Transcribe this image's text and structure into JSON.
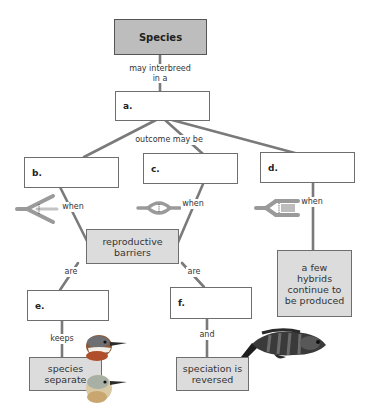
{
  "diagram": {
    "type": "concept-map",
    "colors": {
      "line": "#7a7a7a",
      "title_box_fill": "#bdbdbd",
      "filled_box": "#dcdcdc",
      "empty_box": "#ffffff",
      "icon_gray": "#9a9a9a"
    },
    "nodes": {
      "species": {
        "label": "Species"
      },
      "a": {
        "letter": "a.",
        "text": ""
      },
      "b": {
        "letter": "b.",
        "text": ""
      },
      "c": {
        "letter": "c.",
        "text": ""
      },
      "d": {
        "letter": "d.",
        "text": ""
      },
      "barriers": {
        "label": "reproductive barriers"
      },
      "e": {
        "letter": "e.",
        "text": ""
      },
      "f": {
        "letter": "f.",
        "text": ""
      },
      "hybrids": {
        "label": "a few hybrids continue to be produced"
      },
      "separate": {
        "label": "species separate"
      },
      "reversed": {
        "label": "speciation is reversed"
      }
    },
    "links": {
      "species_a": "may interbreed in a",
      "a_outcomes": "outcome may be",
      "b_when": "when",
      "c_when": "when",
      "d_when": "when",
      "barriers_e": "are",
      "barriers_f": "are",
      "e_keeps": "keeps",
      "f_and": "and"
    },
    "icons": {
      "b": "hybrid-zone-reinforcement-icon",
      "c": "hybrid-zone-fusion-icon",
      "d": "hybrid-zone-stability-icon",
      "birds": "bird-heads-image",
      "fish": "cichlid-fish-image"
    }
  }
}
